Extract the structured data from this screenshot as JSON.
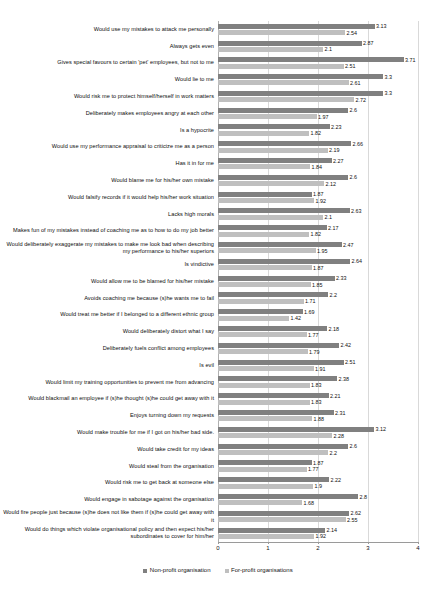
{
  "chart": {
    "type": "bar",
    "orientation": "horizontal",
    "title": "",
    "xlabel": "",
    "ylabel": "",
    "grid": "vertical",
    "legend_position": "bottom-center",
    "colors": {
      "non_profit": "#808080",
      "for_profit": "#bfbfbf",
      "gridline": "#d9d9d9",
      "axis": "#9a9a9a",
      "text": "#111111",
      "background": "#ffffff"
    }
  },
  "axis": {
    "x_min": 0,
    "x_max": 4,
    "ticks": [
      "0",
      "1",
      "2",
      "3",
      "4"
    ],
    "tick_values": [
      0,
      1,
      2,
      3,
      4
    ]
  },
  "legend": {
    "items": [
      {
        "label": "Non-profit organisation",
        "key": "non_profit",
        "color": "#808080"
      },
      {
        "label": "For-profit organisations",
        "key": "for_profit",
        "color": "#bfbfbf"
      }
    ]
  },
  "chart_data": {
    "type": "bar",
    "orientation": "horizontal",
    "title": "",
    "xlabel": "",
    "ylabel": "",
    "xlim": [
      0,
      4
    ],
    "grid": true,
    "legend_position": "bottom",
    "categories": [
      "Would use my mistakes to attack me personally",
      "Always gets even",
      "Gives special favours to certain 'pet' employees, but not to me",
      "Would lie to me",
      "Would risk me to protect himself/herself in work matters",
      "Deliberately makes employees angry at each other",
      "Is a hypocrite",
      "Would use my performance appraisal to criticize me as a person",
      "Has it in for me",
      "Would blame me for his/her own mistake",
      "Would falsify records if it would help his/her work situation",
      "Lacks high morals",
      "Makes fun of my mistakes instead of coaching me as to how to do my job better",
      "Would deliberately exaggerate my mistakes to make me look bad when describing my performance to his/her superiors",
      "Is vindictive",
      "Would allow me to be blamed for his/her mistake",
      "Avoids coaching me because (s)he wants me to fail",
      "Would treat me better if I belonged to a different ethnic group",
      "Would deliberately distort what I say",
      "Deliberately fuels conflict among employees",
      "Is evil",
      "Would limit my training opportunities to prevent me from advancing",
      "Would blackmail an employee if (s)he thought (s)he could get away with it",
      "Enjoys turning down my requests",
      "Would make trouble for me if I got on his/her bad side.",
      "Would take credit for my ideas",
      "Would steal from the organisation",
      "Would risk me to get back at someone else",
      "Would engage in sabotage against the organisation",
      "Would fire people just because (s)he does not like them if (s)he could get away with it",
      "Would do things which violate organisational policy and then expect his/her subordinates to cover for him/her"
    ],
    "series": [
      {
        "name": "Non-profit organisation",
        "color": "#808080",
        "values": [
          3.13,
          2.87,
          3.71,
          3.3,
          3.3,
          2.6,
          2.23,
          2.66,
          2.27,
          2.6,
          1.87,
          2.63,
          2.17,
          2.47,
          2.64,
          2.33,
          2.2,
          1.69,
          2.18,
          2.42,
          2.51,
          2.38,
          2.21,
          2.31,
          3.12,
          2.6,
          1.87,
          2.22,
          2.8,
          2.62,
          2.14
        ]
      },
      {
        "name": "For-profit organisations",
        "color": "#bfbfbf",
        "values": [
          2.54,
          2.1,
          2.51,
          2.61,
          2.72,
          1.97,
          1.82,
          2.19,
          1.84,
          2.12,
          1.92,
          2.1,
          1.82,
          1.95,
          1.87,
          1.85,
          1.71,
          1.42,
          1.77,
          1.79,
          1.91,
          1.83,
          1.83,
          1.88,
          2.28,
          2.2,
          1.77,
          1.9,
          1.68,
          2.55,
          1.92
        ]
      }
    ]
  }
}
